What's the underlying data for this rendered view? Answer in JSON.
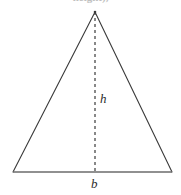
{
  "figure": {
    "name": "triangle-area-diagram",
    "background_color": "#ffffff",
    "width": 181,
    "height": 195,
    "clipped_caption": "height),",
    "outline_color": "#3a3a3a",
    "base_color": "#6b6b6b",
    "dash_color": "#3a3a3a",
    "label_color": "#2b2b2b",
    "outline_width": 1.1,
    "base_width": 1.4,
    "dash_width": 1.2,
    "dash_pattern": "3,3",
    "vertices": {
      "apex": {
        "x": 95,
        "y": 12
      },
      "bottom_left": {
        "x": 13,
        "y": 172
      },
      "bottom_right": {
        "x": 172,
        "y": 172
      }
    },
    "altitude": {
      "from": {
        "x": 95,
        "y": 12
      },
      "to": {
        "x": 95,
        "y": 172
      },
      "style": "dashed"
    },
    "labels": {
      "height": "h",
      "base": "b"
    }
  }
}
